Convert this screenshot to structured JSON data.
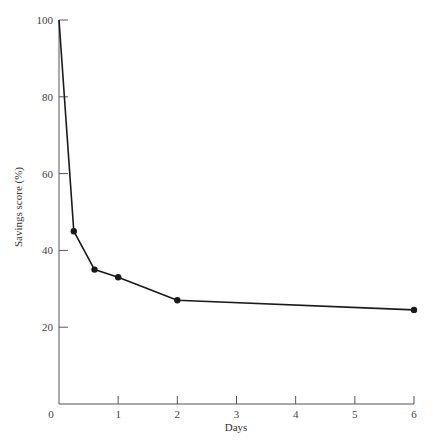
{
  "chart_data": {
    "type": "line",
    "title": "",
    "xlabel": "Days",
    "ylabel": "Savings score (%)",
    "xlim": [
      0,
      6
    ],
    "ylim": [
      0,
      100
    ],
    "x_ticks": [
      0,
      1,
      2,
      3,
      4,
      5,
      6
    ],
    "y_ticks": [
      20,
      40,
      60,
      80,
      100
    ],
    "origin_label": "0",
    "grid": false,
    "legend": null,
    "series": [
      {
        "name": "Savings score",
        "color": "#1a1a1a",
        "x": [
          0,
          0.25,
          0.6,
          1,
          2,
          6
        ],
        "y": [
          100,
          45,
          35,
          33,
          27,
          24.5
        ],
        "markers": [
          false,
          true,
          true,
          true,
          true,
          true
        ]
      }
    ]
  }
}
